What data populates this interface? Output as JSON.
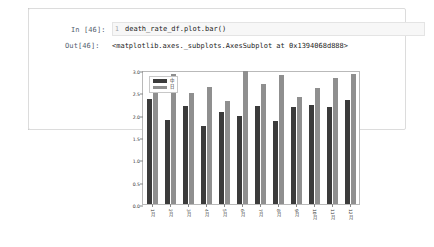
{
  "notebook": {
    "in_prompt": "In [46]:",
    "out_prompt": "Out[46]:",
    "input_gutter": "1",
    "input_code": "death_rate_df.plot.bar()",
    "output_text": "<matplotlib.axes._subplots.AxesSubplot at 0x1394068d888>"
  },
  "chart_data": {
    "type": "bar",
    "title": "",
    "xlabel": "",
    "ylabel": "",
    "ylim": [
      0.0,
      3.0
    ],
    "grid": false,
    "legend_position": "upper left",
    "yticks": [
      "0.0",
      "0.5",
      "1.0",
      "1.5",
      "2.0",
      "2.5",
      "3.0"
    ],
    "ytick_values": [
      0.0,
      0.5,
      1.0,
      1.5,
      2.0,
      2.5,
      3.0
    ],
    "categories": [
      "1月",
      "2月",
      "3月",
      "4月",
      "5月",
      "6月",
      "7月",
      "8月",
      "9月",
      "10月",
      "11月",
      "12月"
    ],
    "series": [
      {
        "name": "中",
        "color": "#3b3b3b",
        "values": [
          2.35,
          1.88,
          2.2,
          1.75,
          2.05,
          1.98,
          2.2,
          1.85,
          2.18,
          2.22,
          2.18,
          2.32
        ]
      },
      {
        "name": "日",
        "color": "#8f8f8f",
        "values": [
          2.48,
          2.9,
          2.48,
          2.62,
          2.3,
          2.98,
          2.68,
          2.88,
          2.4,
          2.6,
          2.82,
          2.9
        ]
      }
    ]
  }
}
